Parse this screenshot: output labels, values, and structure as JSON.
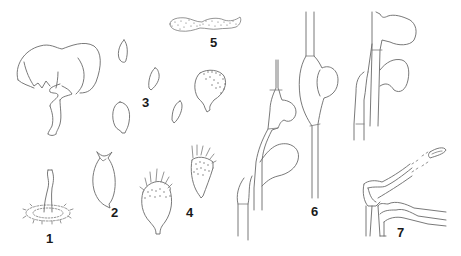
{
  "plate": {
    "background": "#ffffff",
    "line_color": "#6a6a6a",
    "label_color": "#1a1a1a",
    "figures": [
      {
        "id": "fig-1",
        "label": "1",
        "subject": "stalk with fringed basal disc"
      },
      {
        "id": "fig-2",
        "label": "2",
        "subject": "ovoid body with apical horns"
      },
      {
        "id": "fig-3",
        "label": "3",
        "subject": "group of smooth ovoid spores"
      },
      {
        "id": "fig-4",
        "label": "4",
        "subject": "spiny/setose spore bodies"
      },
      {
        "id": "fig-5",
        "label": "5",
        "subject": "dotted (echinulate) elongate body"
      },
      {
        "id": "fig-6",
        "label": "6",
        "subject": "hyphae with lateral swollen vesicles"
      },
      {
        "id": "fig-7",
        "label": "7",
        "subject": "layered tissue section with tubular projection"
      }
    ],
    "unlabeled": [
      {
        "id": "cap-drawing",
        "subject": "cap-shaped fruiting body with twisted stalk (top-left)"
      }
    ]
  }
}
